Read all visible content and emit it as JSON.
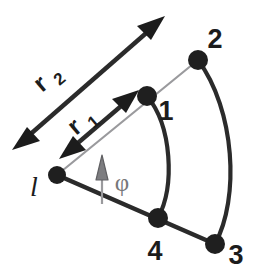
{
  "figure": {
    "background_color": "#ffffff",
    "stroke_color": "#2b2b2b",
    "thin_stroke_color": "#9a9a9d",
    "angle_color": "#77777a",
    "node_fill": "#1f1f1f"
  },
  "vertices": [
    {
      "id": "apex",
      "label": "l",
      "x": 57,
      "y": 175,
      "radius": 9,
      "style": "italic-serif"
    },
    {
      "id": "v1",
      "label": "1",
      "x": 147,
      "y": 96,
      "radius": 10,
      "label_x": 163,
      "label_y": 117
    },
    {
      "id": "v2",
      "label": "2",
      "x": 198,
      "y": 60,
      "radius": 10,
      "label_x": 212,
      "label_y": 45
    },
    {
      "id": "v3",
      "label": "3",
      "x": 215,
      "y": 244,
      "radius": 10,
      "label_x": 231,
      "label_y": 262
    },
    {
      "id": "v4",
      "label": "4",
      "x": 158,
      "y": 218,
      "radius": 10,
      "label_x": 152,
      "label_y": 256
    }
  ],
  "edges": [
    {
      "id": "ray-upper",
      "from": "apex",
      "to": "v2",
      "kind": "straight",
      "weight": "thin",
      "note": "inner radial ray through vertex 1"
    },
    {
      "id": "ray-lower",
      "from": "apex",
      "to": "v3",
      "kind": "straight",
      "weight": "thick",
      "note": "outer radial ray through vertex 4"
    },
    {
      "id": "arc-inner",
      "from": "v1",
      "to": "v4",
      "kind": "arc",
      "weight": "thick",
      "note": "arc of radius r1"
    },
    {
      "id": "arc-outer",
      "from": "v2",
      "to": "v3",
      "kind": "arc",
      "weight": "thick",
      "note": "arc of radius r2"
    }
  ],
  "measures": [
    {
      "id": "r1",
      "label": "r",
      "subscript": "1",
      "arrow": "double-headed",
      "tail_x": 61,
      "tail_y": 157,
      "tip_x": 137,
      "tip_y": 92,
      "label_x": 78,
      "label_y": 133,
      "label_rotation": -40
    },
    {
      "id": "r2",
      "label": "r",
      "subscript": "2",
      "arrow": "double-headed",
      "tail_x": 14,
      "tail_y": 148,
      "tip_x": 163,
      "tip_y": 18,
      "label_x": 44,
      "label_y": 91,
      "label_rotation": -40
    }
  ],
  "angle": {
    "id": "phi",
    "label": "φ",
    "label_x": 120,
    "label_y": 189,
    "arrow_base_x": 102,
    "arrow_base_y": 204,
    "arrow_tip_x": 102,
    "arrow_tip_y": 157,
    "note": "gray vertical arrow marking the sector opening angle at the apex"
  }
}
